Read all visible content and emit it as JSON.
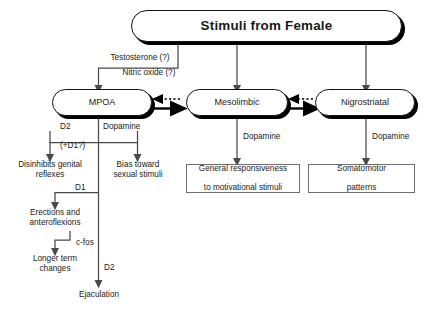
{
  "diagram": {
    "title": "Stimuli from Female",
    "background": "#ffffff",
    "line_color": "#4a4a4a",
    "node_border": "#111111",
    "box_border": "#6f6f6f"
  },
  "nodes": {
    "stimuli": "Stimuli from Female",
    "mpoa": "MPOA",
    "mesolimbic": "Mesolimbic",
    "nigrostriatal": "Nigrostriatal",
    "general_responsiveness": "General responsiveness\nto motivational stimuli",
    "general_responsiveness_line1": "General responsiveness",
    "general_responsiveness_line2": "to motivational stimuli",
    "somatomotor": "Somatomotor\npatterns",
    "somatomotor_line1": "Somatomotor",
    "somatomotor_line2": "patterns"
  },
  "leaf_texts": {
    "disinhibits_line1": "Disinhibits genital",
    "disinhibits_line2": "reflexes",
    "bias_line1": "Bias toward",
    "bias_line2": "sexual stimuli",
    "erections_line1": "Erections and",
    "erections_line2": "anteroflexions",
    "longer_line1": "Longer term",
    "longer_line2": "changes",
    "ejaculation": "Ejaculation"
  },
  "edge_labels": {
    "testosterone": "Testosterone (?)",
    "nitric_oxide": "Nitric oxide (?)",
    "d2_left": "D2",
    "dopamine_mpoa": "Dopamine",
    "plus_d1": "(+D1?)",
    "d1": "D1",
    "c_fos": "c-fos",
    "d2_ejac": "D2",
    "dopamine_meso": "Dopamine",
    "dopamine_nigro": "Dopamine"
  }
}
